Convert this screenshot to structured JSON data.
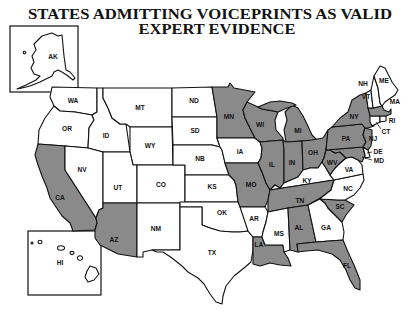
{
  "title": {
    "line1": "STATES ADMITTING VOICEPRINTS AS VALID",
    "line2": "EXPERT EVIDENCE"
  },
  "colors": {
    "admitting": "#8a8a8a",
    "not_admitting": "#ffffff",
    "border": "#111111"
  },
  "legend_meaning": {
    "shaded": "admits voiceprints as valid expert evidence",
    "unshaded": "does not"
  },
  "states": [
    {
      "code": "WA",
      "admits": false
    },
    {
      "code": "OR",
      "admits": false
    },
    {
      "code": "CA",
      "admits": true
    },
    {
      "code": "ID",
      "admits": false
    },
    {
      "code": "NV",
      "admits": false
    },
    {
      "code": "MT",
      "admits": false
    },
    {
      "code": "WY",
      "admits": false
    },
    {
      "code": "UT",
      "admits": false
    },
    {
      "code": "AZ",
      "admits": true
    },
    {
      "code": "CO",
      "admits": false
    },
    {
      "code": "NM",
      "admits": false
    },
    {
      "code": "ND",
      "admits": false
    },
    {
      "code": "SD",
      "admits": false
    },
    {
      "code": "NB",
      "admits": false
    },
    {
      "code": "KS",
      "admits": false
    },
    {
      "code": "OK",
      "admits": false
    },
    {
      "code": "TX",
      "admits": false
    },
    {
      "code": "MN",
      "admits": true
    },
    {
      "code": "IA",
      "admits": false
    },
    {
      "code": "MO",
      "admits": true
    },
    {
      "code": "AR",
      "admits": false
    },
    {
      "code": "LA",
      "admits": true
    },
    {
      "code": "WI",
      "admits": true
    },
    {
      "code": "MI",
      "admits": true
    },
    {
      "code": "IL",
      "admits": true
    },
    {
      "code": "IN",
      "admits": true
    },
    {
      "code": "OH",
      "admits": true
    },
    {
      "code": "KY",
      "admits": false
    },
    {
      "code": "TN",
      "admits": true
    },
    {
      "code": "MS",
      "admits": false
    },
    {
      "code": "AL",
      "admits": true
    },
    {
      "code": "GA",
      "admits": false
    },
    {
      "code": "FL",
      "admits": true
    },
    {
      "code": "SC",
      "admits": true
    },
    {
      "code": "NC",
      "admits": false
    },
    {
      "code": "VA",
      "admits": false
    },
    {
      "code": "WV",
      "admits": true
    },
    {
      "code": "MD",
      "admits": true
    },
    {
      "code": "DE",
      "admits": false
    },
    {
      "code": "PA",
      "admits": true
    },
    {
      "code": "NJ",
      "admits": true
    },
    {
      "code": "NY",
      "admits": true
    },
    {
      "code": "CT",
      "admits": false
    },
    {
      "code": "RI",
      "admits": false
    },
    {
      "code": "MA",
      "admits": true
    },
    {
      "code": "VT",
      "admits": false
    },
    {
      "code": "NH",
      "admits": false
    },
    {
      "code": "ME",
      "admits": false
    },
    {
      "code": "AK",
      "admits": false
    },
    {
      "code": "HI",
      "admits": false
    }
  ]
}
